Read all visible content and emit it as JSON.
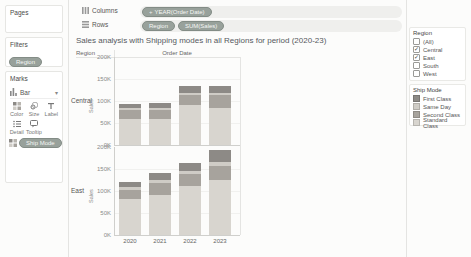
{
  "shelves": {
    "columns": {
      "label": "Columns",
      "pills": [
        {
          "text": "YEAR(Order Date)",
          "prefix": "+"
        }
      ]
    },
    "rows": {
      "label": "Rows",
      "pills": [
        {
          "text": "Region"
        },
        {
          "text": "SUM(Sales)"
        }
      ]
    }
  },
  "sidebar": {
    "pages": {
      "label": "Pages"
    },
    "filters": {
      "label": "Filters",
      "pills": [
        {
          "text": "Region"
        }
      ]
    },
    "marks": {
      "label": "Marks",
      "mark_type": "Bar",
      "buttons": [
        {
          "label": "Color",
          "icon": "color-icon"
        },
        {
          "label": "Size",
          "icon": "size-icon"
        },
        {
          "label": "Label",
          "icon": "label-icon"
        },
        {
          "label": "Detail",
          "icon": "detail-icon"
        },
        {
          "label": "Tooltip",
          "icon": "tooltip-icon"
        }
      ],
      "encodings": [
        {
          "icon": "color-icon",
          "text": "Ship Mode"
        }
      ]
    }
  },
  "sheet": {
    "title": "Sales analysis with Shipping modes in all Regions for period (2020-23)",
    "row_header": "Region",
    "col_header": "Order Date"
  },
  "chart_data": {
    "type": "bar",
    "stacked": true,
    "title": "Sales analysis with Shipping modes in all Regions for period (2020-23)",
    "xlabel": "Order Date",
    "ylabel": "Sales",
    "categories": [
      "2020",
      "2021",
      "2022",
      "2023"
    ],
    "yticks": [
      "200K",
      "150K",
      "100K",
      "50K",
      "0K"
    ],
    "ylim_k": [
      0,
      200
    ],
    "stack_order_top_to_bottom": [
      "First Class",
      "Same Day",
      "Second Class",
      "Standard Class"
    ],
    "panels": [
      {
        "region": "Central",
        "series": [
          {
            "name": "First Class",
            "values_k": [
              11,
              10,
              15,
              16
            ]
          },
          {
            "name": "Same Day",
            "values_k": [
              4,
              5,
              6,
              6
            ]
          },
          {
            "name": "Second Class",
            "values_k": [
              19,
              20,
              22,
              30
            ]
          },
          {
            "name": "Standard Class",
            "values_k": [
              60,
              60,
              91,
              83
            ]
          }
        ]
      },
      {
        "region": "East",
        "series": [
          {
            "name": "First Class",
            "values_k": [
              10,
              17,
              17,
              29
            ]
          },
          {
            "name": "Same Day",
            "values_k": [
              7,
              6,
              8,
              8
            ]
          },
          {
            "name": "Second Class",
            "values_k": [
              22,
              27,
              26,
              33
            ]
          },
          {
            "name": "Standard Class",
            "values_k": [
              81,
              91,
              112,
              124
            ]
          }
        ]
      }
    ]
  },
  "right_panel": {
    "region_filter": {
      "title": "Region",
      "items": [
        {
          "label": "(All)",
          "checked": false
        },
        {
          "label": "Central",
          "checked": true
        },
        {
          "label": "East",
          "checked": true
        },
        {
          "label": "South",
          "checked": false
        },
        {
          "label": "West",
          "checked": false
        }
      ]
    },
    "ship_mode_legend": {
      "title": "Ship Mode",
      "items": [
        {
          "label": "First Class",
          "color": "#8d8a86"
        },
        {
          "label": "Same Day",
          "color": "#cfccc6"
        },
        {
          "label": "Second Class",
          "color": "#a7a39d"
        },
        {
          "label": "Standard Class",
          "color": "#d8d5cf"
        }
      ]
    }
  }
}
